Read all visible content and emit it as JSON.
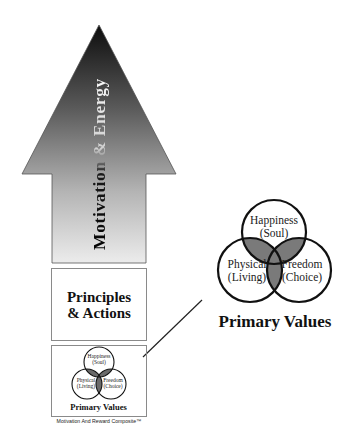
{
  "arrow": {
    "label": "Motivation & Energy",
    "gradient_top": "#111111",
    "gradient_bottom": "#e6e6e6"
  },
  "principles_box": {
    "line1": "Principles",
    "line2": "& Actions"
  },
  "small_venn": {
    "circles": [
      {
        "line1": "Happiness",
        "line2": "(Soul)"
      },
      {
        "line1": "Physical",
        "line2": "(Living)"
      },
      {
        "line1": "Freedom",
        "line2": "(Choice)"
      }
    ],
    "title": "Primary Values"
  },
  "caption": "Motivation And Reward Composite™",
  "large_venn": {
    "circles": [
      {
        "line1": "Happiness",
        "line2": "(Soul)"
      },
      {
        "line1": "Physical",
        "line2": "(Living)"
      },
      {
        "line1": "Freedom",
        "line2": "(Choice)"
      }
    ],
    "title": "Primary Values",
    "overlap_color": "#7a7a7a"
  }
}
